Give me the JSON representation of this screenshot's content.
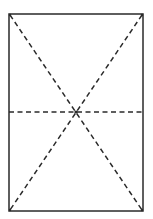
{
  "diagram": {
    "type": "rectangle with dashed diagonals and horizontal midline",
    "rect": {
      "x": 9,
      "y": 14,
      "width": 134,
      "height": 197
    },
    "center": {
      "x": 76,
      "y": 112
    },
    "colors": {
      "stroke": "#2a2a2a",
      "background": "#ffffff"
    },
    "lines": [
      {
        "name": "diagonal-tl-br",
        "style": "dashed"
      },
      {
        "name": "diagonal-tr-bl",
        "style": "dashed"
      },
      {
        "name": "horizontal-midline",
        "style": "dashed"
      }
    ]
  }
}
